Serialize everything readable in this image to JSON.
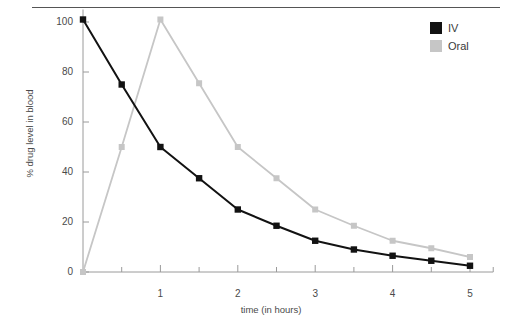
{
  "chart_data": {
    "type": "line",
    "title": "",
    "xlabel": "time (in hours)",
    "ylabel": "% drug level in blood",
    "xlim": [
      0,
      5.3
    ],
    "ylim": [
      0,
      105
    ],
    "grid": false,
    "legend_position": "top-right",
    "x": [
      0,
      0.5,
      1,
      1.5,
      2,
      2.5,
      3,
      3.5,
      4,
      4.5,
      5
    ],
    "xticks": [
      0,
      1,
      2,
      3,
      4,
      5
    ],
    "xtick_labels": [
      "",
      "1",
      "2",
      "3",
      "4",
      "5"
    ],
    "xminor_ticks": [
      0.5,
      1.5,
      2.5,
      3.5,
      4.5,
      5.3
    ],
    "yticks": [
      0,
      20,
      40,
      60,
      80,
      100
    ],
    "ytick_labels": [
      "0",
      "20",
      "40",
      "60",
      "80",
      "100"
    ],
    "series": [
      {
        "name": "IV",
        "color": "#121212",
        "marker": "square",
        "values": [
          101,
          75,
          50,
          37.5,
          25,
          18.5,
          12.5,
          9,
          6.5,
          4.5,
          2.5
        ]
      },
      {
        "name": "Oral",
        "color": "#c6c6c6",
        "marker": "square",
        "values": [
          0,
          50,
          101,
          75.5,
          50,
          37.5,
          25,
          18.5,
          12.5,
          9.5,
          6
        ]
      }
    ]
  },
  "legend": {
    "items": [
      {
        "label": "IV",
        "color": "#121212"
      },
      {
        "label": "Oral",
        "color": "#c6c6c6"
      }
    ]
  },
  "colors": {
    "iv": "#121212",
    "oral": "#c6c6c6",
    "axis": "#9a9a9a",
    "rule": "#555555",
    "text": "#4a4a4a"
  }
}
